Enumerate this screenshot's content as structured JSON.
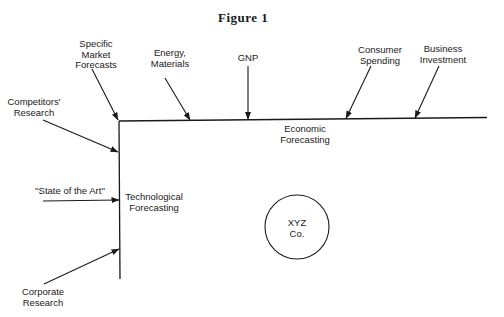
{
  "title": "Figure 1",
  "labels": {
    "specific_market": "Specific\nMarket\nForecasts",
    "energy": "Energy,\nMaterials",
    "gnp": "GNP",
    "consumer": "Consumer\nSpending",
    "business": "Business\nInvestment",
    "competitors": "Competitors'\nResearch",
    "state_of_art": "''State of the Art''",
    "corporate": "Corporate\nResearch",
    "economic": "Economic\nForecasting",
    "technological": "Technological\nForecasting",
    "company": "XYZ\nCo."
  },
  "colors": {
    "ink": "#1a1a1a",
    "background": "#ffffff"
  }
}
